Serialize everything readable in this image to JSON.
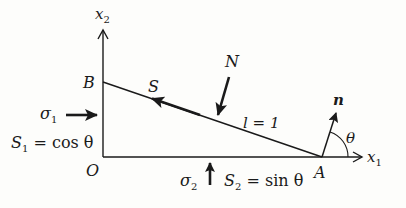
{
  "diagram": {
    "axes": {
      "x1_label": "x",
      "x1_sub": "1",
      "x2_label": "x",
      "x2_sub": "2"
    },
    "points": {
      "origin": "O",
      "B": "B",
      "A": "A"
    },
    "forces": {
      "S_label": "S",
      "N_label": "N",
      "normal_label": "n",
      "sigma1_label": "σ",
      "sigma1_sub": "1",
      "sigma2_label": "σ",
      "sigma2_sub": "2"
    },
    "annotations": {
      "length": "l = 1",
      "angle": "θ",
      "S1_label": "S",
      "S1_sub": "1",
      "S1_eq": " = cos θ",
      "S2_label": "S",
      "S2_sub": "2",
      "S2_eq": " = sin θ"
    },
    "colors": {
      "ink": "#1a1a1a",
      "background": "#fdfdfb"
    }
  }
}
